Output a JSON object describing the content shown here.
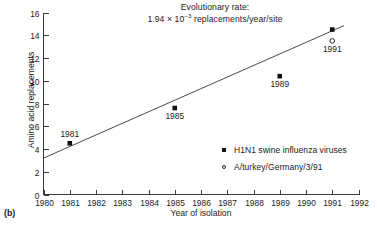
{
  "panel": {
    "letter": "(b)"
  },
  "chart_data": {
    "type": "scatter",
    "title": "Evolutionary rate:",
    "subtitle_prefix": "1.94 × 10",
    "subtitle_exponent": "–3",
    "subtitle_suffix": " replacements/year/site",
    "xlabel": "Year of isolation",
    "ylabel": "Amino acid replacements",
    "xlim": [
      1980,
      1992
    ],
    "ylim": [
      0,
      16
    ],
    "xticks": [
      1980,
      1981,
      1982,
      1983,
      1984,
      1985,
      1986,
      1987,
      1988,
      1989,
      1990,
      1991,
      1992
    ],
    "yticks": [
      0,
      2,
      4,
      6,
      8,
      10,
      12,
      14,
      16
    ],
    "grid": false,
    "legend_position": "inside-lower-right",
    "series": [
      {
        "name": "H1N1 swine influenza viruses",
        "marker": "filled-square",
        "points": [
          {
            "x": 1981,
            "y": 4.5,
            "label": "1981",
            "label_pos": "above"
          },
          {
            "x": 1985,
            "y": 7.6,
            "label": "1985",
            "label_pos": "below"
          },
          {
            "x": 1989,
            "y": 10.4,
            "label": "1989",
            "label_pos": "below"
          },
          {
            "x": 1991,
            "y": 14.5,
            "label": "",
            "label_pos": "none"
          }
        ]
      },
      {
        "name": "A/turkey/Germany/3/91",
        "marker": "open-circle",
        "points": [
          {
            "x": 1991,
            "y": 13.5,
            "label": "1991",
            "label_pos": "below"
          }
        ]
      }
    ],
    "fit_line": {
      "name": "regression-line",
      "x_start": 1980,
      "y_start": 3.2,
      "x_end": 1991.45,
      "y_end": 14.85
    },
    "colors": {
      "axis": "#3a3a3a",
      "line": "#4a4a4a",
      "marker": "#111111",
      "text": "#1a1a1a",
      "background": "#ffffff"
    }
  }
}
